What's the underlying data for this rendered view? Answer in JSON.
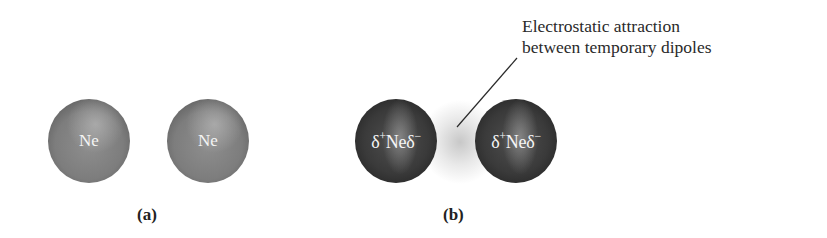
{
  "figure": {
    "panel_a": {
      "caption": "(a)",
      "atoms": [
        {
          "symbol": "Ne"
        },
        {
          "symbol": "Ne"
        }
      ]
    },
    "panel_b": {
      "caption": "(b)",
      "atoms": [
        {
          "delta_plus": "δ",
          "plus_sign": "+",
          "symbol": "Ne",
          "delta_minus": "δ",
          "minus_sign": "−"
        },
        {
          "delta_plus": "δ",
          "plus_sign": "+",
          "symbol": "Ne",
          "delta_minus": "δ",
          "minus_sign": "−"
        }
      ],
      "annotation": {
        "line1": "Electrostatic attraction",
        "line2": "between temporary dipoles"
      }
    }
  },
  "colors": {
    "neutral_atom": "#7d7d7d",
    "dipole_atom": "#3a3a3a",
    "attraction_glow": "#cfcfcf",
    "atom_label": "#f4f4f4",
    "text": "#222222"
  }
}
